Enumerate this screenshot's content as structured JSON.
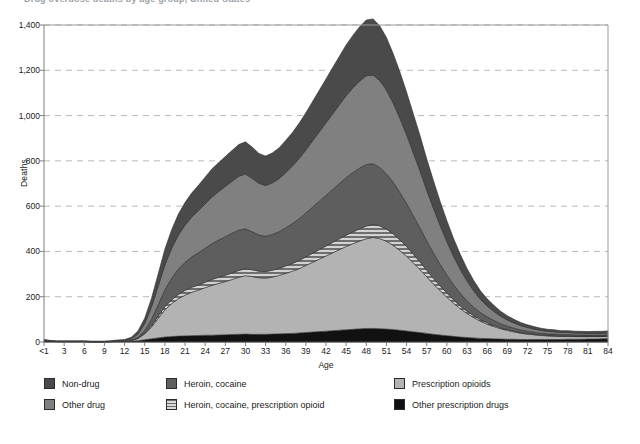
{
  "title_partial": "Drug overdose deaths by age group, United States",
  "axes": {
    "ylabel": "Deaths",
    "xlabel": "Age",
    "yticks": [
      "0",
      "200",
      "400",
      "600",
      "800",
      "1,000",
      "1,200",
      "1,400"
    ],
    "xticks": [
      "<1",
      "3",
      "6",
      "9",
      "12",
      "15",
      "18",
      "21",
      "24",
      "27",
      "30",
      "33",
      "36",
      "39",
      "42",
      "45",
      "48",
      "51",
      "54",
      "57",
      "60",
      "63",
      "66",
      "69",
      "72",
      "75",
      "78",
      "81",
      "84"
    ]
  },
  "legend": {
    "items": [
      {
        "label": "Non-drug",
        "color": "#4a4a4a",
        "pattern": "solid",
        "col": 0,
        "row": 0
      },
      {
        "label": "Other drug",
        "color": "#808080",
        "pattern": "solid",
        "col": 0,
        "row": 1
      },
      {
        "label": "Heroin, cocaine",
        "color": "#5e5e5e",
        "pattern": "solid",
        "col": 1,
        "row": 0
      },
      {
        "label": "Heroin, cocaine, prescription opioid",
        "color": "#9a9a9a",
        "pattern": "hatch",
        "col": 1,
        "row": 1
      },
      {
        "label": "Prescription opioids",
        "color": "#b3b3b3",
        "pattern": "solid",
        "col": 2,
        "row": 0
      },
      {
        "label": "Other prescription drugs",
        "color": "#111111",
        "pattern": "solid",
        "col": 2,
        "row": 1
      }
    ]
  },
  "chart_data": {
    "type": "area",
    "stacked": true,
    "title": "Drug overdose deaths by age group, United States",
    "xlabel": "Age",
    "ylabel": "Deaths",
    "xlim": [
      0,
      84
    ],
    "ylim": [
      0,
      1400
    ],
    "ytick_step": 200,
    "grid": "horizontal-dashed",
    "legend_position": "below",
    "x": [
      0,
      1,
      2,
      3,
      4,
      5,
      6,
      7,
      8,
      9,
      10,
      11,
      12,
      13,
      14,
      15,
      16,
      17,
      18,
      19,
      20,
      21,
      22,
      23,
      24,
      25,
      26,
      27,
      28,
      29,
      30,
      31,
      32,
      33,
      34,
      35,
      36,
      37,
      38,
      39,
      40,
      41,
      42,
      43,
      44,
      45,
      46,
      47,
      48,
      49,
      50,
      51,
      52,
      53,
      54,
      55,
      56,
      57,
      58,
      59,
      60,
      61,
      62,
      63,
      64,
      65,
      66,
      67,
      68,
      69,
      70,
      71,
      72,
      73,
      74,
      75,
      76,
      77,
      78,
      79,
      80,
      81,
      82,
      83,
      84
    ],
    "x_tick_labels": [
      "<1",
      "3",
      "6",
      "9",
      "12",
      "15",
      "18",
      "21",
      "24",
      "27",
      "30",
      "33",
      "36",
      "39",
      "42",
      "45",
      "48",
      "51",
      "54",
      "57",
      "60",
      "63",
      "66",
      "69",
      "72",
      "75",
      "78",
      "81",
      "84"
    ],
    "series": [
      {
        "name": "Other prescription drugs",
        "color": "#111111",
        "pattern": "solid",
        "values": [
          6,
          3,
          2,
          2,
          2,
          2,
          2,
          1,
          1,
          1,
          2,
          2,
          2,
          3,
          6,
          10,
          14,
          18,
          22,
          24,
          26,
          27,
          28,
          29,
          30,
          30,
          31,
          32,
          33,
          34,
          35,
          34,
          34,
          34,
          35,
          36,
          37,
          38,
          40,
          42,
          44,
          46,
          48,
          50,
          52,
          54,
          56,
          58,
          60,
          60,
          59,
          57,
          55,
          52,
          49,
          45,
          42,
          38,
          34,
          31,
          28,
          25,
          22,
          20,
          18,
          16,
          15,
          14,
          13,
          12,
          12,
          11,
          11,
          11,
          11,
          11,
          11,
          11,
          12,
          12,
          12,
          13,
          13,
          14,
          15
        ]
      },
      {
        "name": "Prescription opioids",
        "color": "#b3b3b3",
        "pattern": "solid",
        "values": [
          0,
          0,
          0,
          0,
          0,
          0,
          0,
          0,
          0,
          0,
          0,
          1,
          1,
          3,
          10,
          26,
          52,
          86,
          120,
          145,
          165,
          180,
          192,
          200,
          210,
          220,
          228,
          235,
          243,
          252,
          258,
          255,
          250,
          248,
          252,
          258,
          266,
          275,
          284,
          296,
          308,
          320,
          332,
          344,
          356,
          368,
          378,
          388,
          396,
          402,
          398,
          388,
          372,
          352,
          330,
          305,
          278,
          250,
          222,
          196,
          170,
          146,
          125,
          106,
          90,
          76,
          64,
          54,
          46,
          39,
          33,
          28,
          24,
          21,
          18,
          16,
          15,
          14,
          13,
          12,
          12,
          11,
          11,
          10,
          10
        ]
      },
      {
        "name": "Heroin, cocaine, prescription opioid",
        "color": "#9a9a9a",
        "pattern": "hatch",
        "values": [
          0,
          0,
          0,
          0,
          0,
          0,
          0,
          0,
          0,
          0,
          0,
          0,
          0,
          0,
          1,
          3,
          6,
          10,
          14,
          17,
          19,
          21,
          22,
          23,
          24,
          26,
          27,
          28,
          29,
          30,
          31,
          30,
          29,
          29,
          30,
          31,
          33,
          34,
          36,
          38,
          40,
          42,
          44,
          46,
          48,
          50,
          52,
          54,
          56,
          57,
          56,
          54,
          51,
          47,
          43,
          38,
          34,
          29,
          25,
          21,
          18,
          15,
          12,
          10,
          8,
          7,
          6,
          5,
          4,
          4,
          3,
          3,
          3,
          2,
          2,
          2,
          2,
          2,
          2,
          2,
          2,
          2,
          2,
          2,
          2
        ]
      },
      {
        "name": "Heroin, cocaine",
        "color": "#5e5e5e",
        "pattern": "solid",
        "values": [
          0,
          0,
          0,
          0,
          0,
          0,
          0,
          0,
          0,
          0,
          0,
          0,
          0,
          1,
          4,
          12,
          28,
          50,
          74,
          95,
          112,
          124,
          134,
          142,
          150,
          158,
          164,
          170,
          175,
          178,
          176,
          168,
          160,
          156,
          158,
          162,
          168,
          176,
          184,
          194,
          204,
          214,
          224,
          234,
          244,
          254,
          262,
          268,
          272,
          268,
          258,
          244,
          228,
          210,
          190,
          170,
          150,
          130,
          112,
          95,
          80,
          67,
          56,
          46,
          38,
          31,
          26,
          22,
          18,
          15,
          13,
          11,
          10,
          9,
          8,
          7,
          7,
          6,
          6,
          6,
          5,
          5,
          5,
          5,
          5
        ]
      },
      {
        "name": "Other drug",
        "color": "#808080",
        "pattern": "solid",
        "values": [
          2,
          1,
          1,
          1,
          1,
          1,
          1,
          1,
          1,
          1,
          1,
          2,
          3,
          6,
          14,
          30,
          54,
          82,
          110,
          132,
          150,
          164,
          176,
          186,
          196,
          206,
          214,
          222,
          230,
          238,
          242,
          236,
          228,
          224,
          228,
          234,
          244,
          254,
          266,
          278,
          292,
          306,
          320,
          334,
          348,
          362,
          374,
          384,
          392,
          392,
          384,
          370,
          350,
          328,
          304,
          278,
          252,
          224,
          198,
          172,
          148,
          126,
          106,
          88,
          72,
          58,
          48,
          40,
          33,
          27,
          23,
          19,
          16,
          14,
          12,
          11,
          10,
          9,
          9,
          8,
          8,
          7,
          7,
          7,
          7
        ]
      },
      {
        "name": "Non-drug",
        "color": "#4a4a4a",
        "pattern": "solid",
        "values": [
          4,
          2,
          2,
          2,
          2,
          2,
          2,
          2,
          2,
          2,
          3,
          4,
          5,
          8,
          14,
          24,
          38,
          54,
          70,
          82,
          92,
          100,
          106,
          112,
          118,
          124,
          128,
          132,
          136,
          140,
          142,
          138,
          132,
          130,
          132,
          136,
          142,
          148,
          156,
          164,
          174,
          184,
          194,
          204,
          214,
          224,
          232,
          240,
          246,
          248,
          242,
          232,
          218,
          204,
          188,
          172,
          156,
          138,
          122,
          106,
          92,
          78,
          66,
          55,
          46,
          38,
          32,
          27,
          22,
          19,
          16,
          14,
          12,
          11,
          10,
          9,
          9,
          8,
          8,
          8,
          8,
          8,
          9,
          9,
          10
        ]
      }
    ],
    "notes": {
      "peak_total_deaths": 1150,
      "peak_age": 49,
      "secondary_peak_total_deaths": 840,
      "secondary_peak_age": 30
    }
  }
}
